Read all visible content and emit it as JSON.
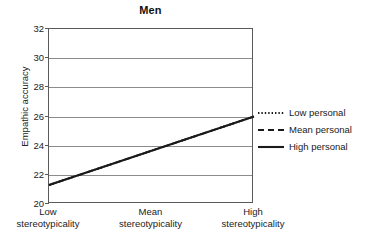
{
  "chart_data": {
    "type": "line",
    "title": "Men",
    "xlabel": "",
    "ylabel": "Empathic accuracy",
    "categories": [
      "Low\nstereotypicality",
      "Mean\nstereotypicality",
      "High\nstereotypicality"
    ],
    "category_lines": [
      {
        "line1": "Low",
        "line2": "stereotypicality"
      },
      {
        "line1": "Mean",
        "line2": "stereotypicality"
      },
      {
        "line1": "High",
        "line2": "stereotypicality"
      }
    ],
    "x": [
      0,
      1,
      2
    ],
    "ylim": [
      20,
      32
    ],
    "yticks": [
      20,
      22,
      24,
      26,
      28,
      30,
      32
    ],
    "ytick_labels": [
      "20",
      "22",
      "24",
      "26",
      "28",
      "30",
      "32"
    ],
    "grid": "horizontal",
    "legend_position": "right",
    "series": [
      {
        "name": "Low personal",
        "style": "dotted",
        "color": "#1a1a1a",
        "values": [
          21.3,
          23.65,
          26.0
        ]
      },
      {
        "name": "Mean personal",
        "style": "dashed",
        "color": "#1a1a1a",
        "values": [
          21.3,
          23.65,
          26.0
        ]
      },
      {
        "name": "High personal",
        "style": "solid",
        "color": "#1a1a1a",
        "values": [
          21.3,
          23.65,
          26.0
        ]
      }
    ],
    "note": "All three series overlap exactly on the same line"
  },
  "legend": {
    "items": [
      {
        "label": "Low personal",
        "style": "dotted"
      },
      {
        "label": "Mean personal",
        "style": "dashed"
      },
      {
        "label": "High personal",
        "style": "solid"
      }
    ]
  },
  "colors": {
    "line": "#1a1a1a",
    "axis": "#5a5a5a",
    "grid": "#8c8c8c",
    "text": "#222222",
    "background": "#ffffff"
  }
}
